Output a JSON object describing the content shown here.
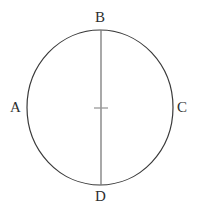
{
  "figure": {
    "type": "geometry-diagram",
    "background_color": "#ffffff",
    "canvas": {
      "width": 199,
      "height": 215
    },
    "circle": {
      "name": "circle-outline",
      "center_x": 100,
      "center_y": 107.5,
      "radius_x": 73,
      "radius_y": 77.5,
      "stroke_color": "#3a3a3a",
      "stroke_width": 1.2,
      "fill": "none"
    },
    "diameter_line": {
      "name": "vertical-diameter-BD",
      "x1": 101,
      "y1": 30,
      "x2": 101,
      "y2": 185,
      "stroke_color": "#7a7a7a",
      "stroke_width": 1.3
    },
    "center_tick": {
      "name": "center-tick-mark",
      "x1": 94,
      "y1": 108,
      "x2": 108,
      "y2": 108,
      "stroke_color": "#9a9a9a",
      "stroke_width": 1.3
    },
    "labels": [
      {
        "id": "A",
        "text": "A",
        "position": "left",
        "x": 10,
        "y": 100
      },
      {
        "id": "B",
        "text": "B",
        "position": "top",
        "x": 95,
        "y": 10
      },
      {
        "id": "C",
        "text": "C",
        "position": "right",
        "x": 177,
        "y": 100
      },
      {
        "id": "D",
        "text": "D",
        "position": "bottom",
        "x": 95,
        "y": 189
      }
    ],
    "label_color": "#2e2e2e",
    "label_font_size": 15
  }
}
